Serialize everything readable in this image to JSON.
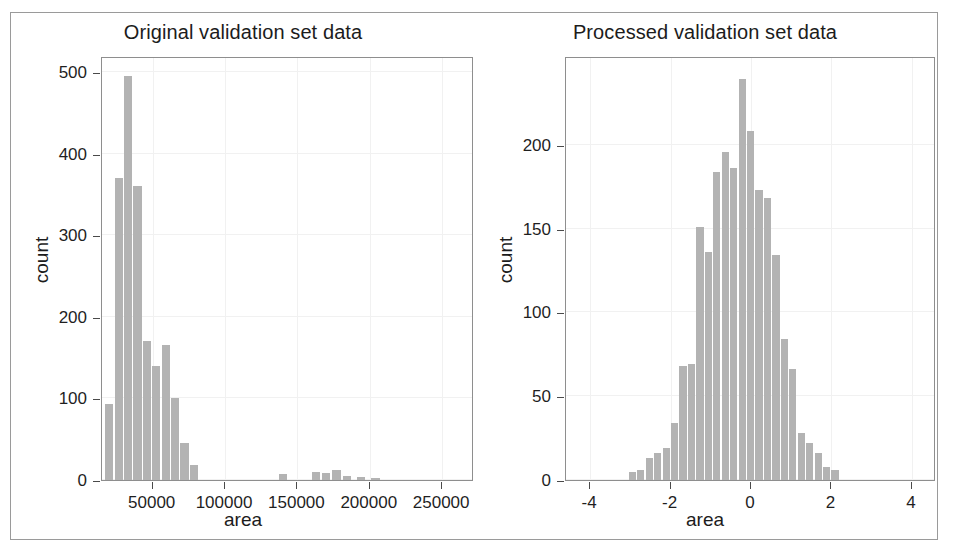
{
  "figure": {
    "panels": [
      "left",
      "right"
    ],
    "bar_color": "#b3b3b3",
    "axis_color": "#4a4a4a",
    "frame_color": "#9a9a9a"
  },
  "chart_data": [
    {
      "type": "bar",
      "id": "original",
      "title": "Original validation set data",
      "xlabel": "area",
      "ylabel": "count",
      "xlim": [
        15000,
        272000
      ],
      "ylim": [
        0,
        520
      ],
      "xticks": [
        50000,
        100000,
        150000,
        200000,
        250000
      ],
      "xtick_labels": [
        "50000",
        "100000",
        "150000",
        "200000",
        "250000"
      ],
      "yticks": [
        0,
        100,
        200,
        300,
        400,
        500
      ],
      "ytick_labels": [
        "0",
        "100",
        "200",
        "300",
        "400",
        "500"
      ],
      "grid": true,
      "legend": "none",
      "bin_width": 6500,
      "bins": [
        {
          "x": 20000,
          "value": 93
        },
        {
          "x": 26500,
          "value": 370
        },
        {
          "x": 33000,
          "value": 495
        },
        {
          "x": 39500,
          "value": 360
        },
        {
          "x": 46000,
          "value": 170
        },
        {
          "x": 52500,
          "value": 140
        },
        {
          "x": 59000,
          "value": 166
        },
        {
          "x": 65500,
          "value": 101
        },
        {
          "x": 72000,
          "value": 45
        },
        {
          "x": 78500,
          "value": 19
        },
        {
          "x": 140000,
          "value": 7
        },
        {
          "x": 163000,
          "value": 10
        },
        {
          "x": 170000,
          "value": 9
        },
        {
          "x": 177000,
          "value": 12
        },
        {
          "x": 184000,
          "value": 5
        },
        {
          "x": 194000,
          "value": 4
        },
        {
          "x": 204000,
          "value": 3
        }
      ]
    },
    {
      "type": "bar",
      "id": "processed",
      "title": "Processed validation set data",
      "xlabel": "area",
      "ylabel": "count",
      "xlim": [
        -4.6,
        4.6
      ],
      "ylim": [
        0,
        253
      ],
      "xticks": [
        -4,
        -2,
        0,
        2,
        4
      ],
      "xtick_labels": [
        "-4",
        "-2",
        "0",
        "2",
        "4"
      ],
      "yticks": [
        0,
        50,
        100,
        150,
        200
      ],
      "ytick_labels": [
        "0",
        "50",
        "100",
        "150",
        "200"
      ],
      "grid": true,
      "legend": "none",
      "bin_width": 0.21,
      "bins": [
        {
          "x": -2.95,
          "value": 5
        },
        {
          "x": -2.74,
          "value": 6
        },
        {
          "x": -2.53,
          "value": 13
        },
        {
          "x": -2.32,
          "value": 16
        },
        {
          "x": -2.11,
          "value": 19
        },
        {
          "x": -1.9,
          "value": 34
        },
        {
          "x": -1.69,
          "value": 68
        },
        {
          "x": -1.48,
          "value": 69
        },
        {
          "x": -1.27,
          "value": 151
        },
        {
          "x": -1.06,
          "value": 136
        },
        {
          "x": -0.85,
          "value": 184
        },
        {
          "x": -0.64,
          "value": 196
        },
        {
          "x": -0.43,
          "value": 186
        },
        {
          "x": -0.22,
          "value": 239
        },
        {
          "x": -0.01,
          "value": 208
        },
        {
          "x": 0.2,
          "value": 173
        },
        {
          "x": 0.41,
          "value": 168
        },
        {
          "x": 0.62,
          "value": 134
        },
        {
          "x": 0.83,
          "value": 84
        },
        {
          "x": 1.04,
          "value": 66
        },
        {
          "x": 1.25,
          "value": 28
        },
        {
          "x": 1.46,
          "value": 22
        },
        {
          "x": 1.67,
          "value": 16
        },
        {
          "x": 1.88,
          "value": 8
        },
        {
          "x": 2.09,
          "value": 6
        }
      ]
    }
  ]
}
